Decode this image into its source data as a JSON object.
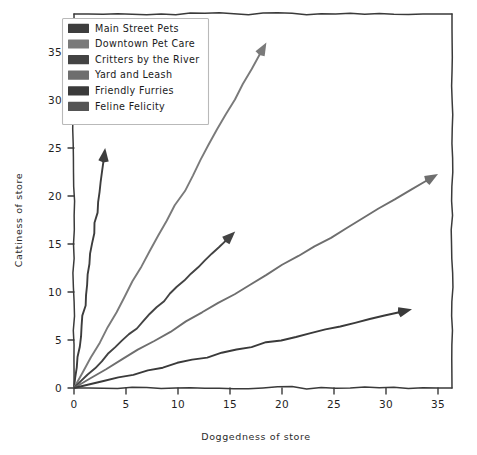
{
  "chart_data": {
    "type": "line",
    "title": "",
    "xlabel": "Doggedness of store",
    "ylabel": "Cattiness of store",
    "xlim": [
      0,
      37
    ],
    "ylim": [
      0,
      38
    ],
    "xticks": [
      0,
      5,
      10,
      15,
      20,
      25,
      30,
      35
    ],
    "xtick_labels": [
      "0",
      "5",
      "10",
      "15",
      "20",
      "25",
      "30",
      "35"
    ],
    "yticks": [
      0,
      5,
      10,
      15,
      20,
      25,
      30,
      35
    ],
    "ytick_labels": [
      "0",
      "5",
      "10",
      "15",
      "20",
      "25",
      "30",
      "35"
    ],
    "grid": false,
    "style": "hand-drawn",
    "legend_position": "upper left",
    "origin": [
      0,
      0
    ],
    "series": [
      {
        "name": "Main Street Pets",
        "color": "#3d3d3d",
        "start": [
          0,
          0
        ],
        "end": [
          3.0,
          25.0
        ]
      },
      {
        "name": "Downtown Pet Care",
        "color": "#7a7a7a",
        "start": [
          0,
          0
        ],
        "end": [
          18.5,
          36.0
        ]
      },
      {
        "name": "Critters by the River",
        "color": "#434343",
        "start": [
          0,
          0
        ],
        "end": [
          15.5,
          16.3
        ]
      },
      {
        "name": "Yard and Leash",
        "color": "#6e6e6e",
        "start": [
          0,
          0
        ],
        "end": [
          35.0,
          22.3
        ]
      },
      {
        "name": "Friendly Furries",
        "color": "#3a3a3a",
        "start": [
          0,
          0
        ],
        "end": [
          32.5,
          8.2
        ]
      },
      {
        "name": "Feline Felicity",
        "color": "#545454",
        "start": [
          0,
          0
        ],
        "end": [
          0.0,
          0.0
        ]
      }
    ]
  },
  "legend": {
    "items": [
      {
        "label": "Main Street Pets",
        "color": "#3d3d3d"
      },
      {
        "label": "Downtown Pet Care",
        "color": "#7a7a7a"
      },
      {
        "label": "Critters by the River",
        "color": "#434343"
      },
      {
        "label": "Yard and Leash",
        "color": "#6e6e6e"
      },
      {
        "label": "Friendly Furries",
        "color": "#3a3a3a"
      },
      {
        "label": "Feline Felicity",
        "color": "#545454"
      }
    ]
  },
  "axes": {
    "x_title": "Doggedness of store",
    "y_title": "Cattiness of store"
  }
}
